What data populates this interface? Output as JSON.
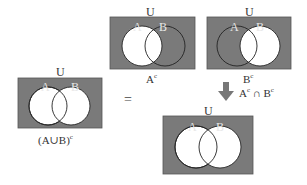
{
  "colors": {
    "universe": "#7a7a7a",
    "empty": "#ffffff",
    "outline": "#222222",
    "arrow": "#777777"
  },
  "diagrams": [
    {
      "id": "left",
      "universe_label": "U",
      "set_a_label": "A",
      "set_b_label": "B",
      "caption": "(A∪B)",
      "caption_sup": "c",
      "shaded": "complement of A∪B"
    },
    {
      "id": "top-middle",
      "universe_label": "U",
      "set_a_label": "A",
      "set_b_label": "B",
      "caption": "A",
      "caption_sup": "c",
      "shaded": "complement of A"
    },
    {
      "id": "top-right",
      "universe_label": "U",
      "set_a_label": "A",
      "set_b_label": "B",
      "caption": "B",
      "caption_sup": "c",
      "shaded": "complement of B"
    },
    {
      "id": "bottom",
      "universe_label": "U",
      "set_a_label": "A",
      "set_b_label": "B",
      "caption": "",
      "caption_sup": "",
      "shaded": "Ac ∩ Bc"
    }
  ],
  "equals_sign": "=",
  "arrow_label": {
    "a": "A",
    "a_sup": "c",
    "op": " ∩ ",
    "b": "B",
    "b_sup": "c"
  }
}
